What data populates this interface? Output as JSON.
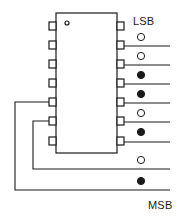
{
  "diagram": {
    "type": "14-pin DIP IC with 8 output bit lines",
    "labels": {
      "lsb": "LSB",
      "msb": "MSB"
    },
    "chip": {
      "x": 56,
      "y": 13,
      "width": 61,
      "height": 140,
      "notch_dot": {
        "cx": 67,
        "cy": 23,
        "r": 2
      }
    },
    "left_pins_y": [
      26,
      45,
      64,
      83,
      102,
      121,
      141
    ],
    "right_pins_y": [
      26,
      45,
      64,
      83,
      102,
      121,
      141
    ],
    "bits": [
      {
        "index": 0,
        "line_y": 46,
        "state": "open"
      },
      {
        "index": 1,
        "line_y": 65,
        "state": "open"
      },
      {
        "index": 2,
        "line_y": 84,
        "state": "filled"
      },
      {
        "index": 3,
        "line_y": 103,
        "state": "filled"
      },
      {
        "index": 4,
        "line_y": 122,
        "state": "open"
      },
      {
        "index": 5,
        "line_y": 141,
        "state": "filled"
      },
      {
        "index": 6,
        "line_y": 169,
        "state": "open"
      },
      {
        "index": 7,
        "line_y": 190,
        "state": "filled"
      }
    ],
    "colors": {
      "stroke": "#1a1a1a",
      "background": "#ffffff"
    }
  }
}
